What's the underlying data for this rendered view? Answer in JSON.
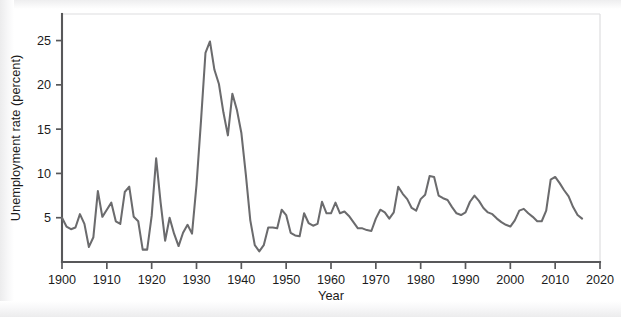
{
  "chart_data": {
    "type": "line",
    "title": "",
    "xlabel": "Year",
    "ylabel": "Unemployment rate (percent)",
    "xlim": [
      1900,
      2020
    ],
    "ylim": [
      0,
      28
    ],
    "grid": false,
    "legend": null,
    "line_color": "#6b6b6d",
    "axis_color": "#58585a",
    "background_color": "#ffffff",
    "xticks": [
      1900,
      1910,
      1920,
      1930,
      1940,
      1950,
      1960,
      1970,
      1980,
      1990,
      2000,
      2010,
      2020
    ],
    "xtick_labels": [
      "1900",
      "1910",
      "1920",
      "1930",
      "1940",
      "1950",
      "1960",
      "1970",
      "1980",
      "1990",
      "2000",
      "2010",
      "2020"
    ],
    "yticks": [
      5,
      10,
      15,
      20,
      25
    ],
    "ytick_labels": [
      "5",
      "10",
      "15",
      "20",
      "25"
    ],
    "series": [
      {
        "name": "Unemployment rate",
        "x": [
          1900,
          1901,
          1902,
          1903,
          1904,
          1905,
          1906,
          1907,
          1908,
          1909,
          1910,
          1911,
          1912,
          1913,
          1914,
          1915,
          1916,
          1917,
          1918,
          1919,
          1920,
          1921,
          1922,
          1923,
          1924,
          1925,
          1926,
          1927,
          1928,
          1929,
          1930,
          1931,
          1932,
          1933,
          1934,
          1935,
          1936,
          1937,
          1938,
          1939,
          1940,
          1941,
          1942,
          1943,
          1944,
          1945,
          1946,
          1947,
          1948,
          1949,
          1950,
          1951,
          1952,
          1953,
          1954,
          1955,
          1956,
          1957,
          1958,
          1959,
          1960,
          1961,
          1962,
          1963,
          1964,
          1965,
          1966,
          1967,
          1968,
          1969,
          1970,
          1971,
          1972,
          1973,
          1974,
          1975,
          1976,
          1977,
          1978,
          1979,
          1980,
          1981,
          1982,
          1983,
          1984,
          1985,
          1986,
          1987,
          1988,
          1989,
          1990,
          1991,
          1992,
          1993,
          1994,
          1995,
          1996,
          1997,
          1998,
          1999,
          2000,
          2001,
          2002,
          2003,
          2004,
          2005,
          2006,
          2007,
          2008,
          2009,
          2010,
          2011,
          2012,
          2013,
          2014,
          2015,
          2016
        ],
        "values": [
          5.0,
          4.0,
          3.7,
          3.9,
          5.4,
          4.3,
          1.7,
          2.8,
          8.0,
          5.1,
          5.9,
          6.7,
          4.6,
          4.3,
          7.9,
          8.5,
          5.1,
          4.6,
          1.4,
          1.4,
          5.2,
          11.7,
          6.7,
          2.4,
          5.0,
          3.2,
          1.8,
          3.3,
          4.2,
          3.2,
          8.7,
          15.9,
          23.6,
          24.9,
          21.7,
          20.1,
          16.9,
          14.3,
          19.0,
          17.2,
          14.6,
          9.9,
          4.7,
          1.9,
          1.2,
          1.9,
          3.9,
          3.9,
          3.8,
          5.9,
          5.3,
          3.3,
          3.0,
          2.9,
          5.5,
          4.4,
          4.1,
          4.3,
          6.8,
          5.5,
          5.5,
          6.7,
          5.5,
          5.7,
          5.2,
          4.5,
          3.8,
          3.8,
          3.6,
          3.5,
          4.9,
          5.9,
          5.6,
          4.9,
          5.6,
          8.5,
          7.7,
          7.1,
          6.1,
          5.8,
          7.1,
          7.6,
          9.7,
          9.6,
          7.5,
          7.2,
          7.0,
          6.2,
          5.5,
          5.3,
          5.6,
          6.8,
          7.5,
          6.9,
          6.1,
          5.6,
          5.4,
          4.9,
          4.5,
          4.2,
          4.0,
          4.7,
          5.8,
          6.0,
          5.5,
          5.1,
          4.6,
          4.6,
          5.8,
          9.3,
          9.6,
          8.9,
          8.1,
          7.4,
          6.2,
          5.3,
          4.9
        ]
      }
    ]
  },
  "axes": {
    "y_axis_title": "Unemployment rate (percent)",
    "x_axis_title": "Year"
  }
}
